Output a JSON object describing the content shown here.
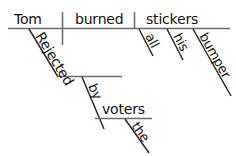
{
  "diagram": {
    "type": "reed-kellogg-sentence-diagram",
    "sentence": "Tom burned all his bumper stickers. Rejected by the voters.",
    "baseline": {
      "subject": "Tom",
      "verb": "burned",
      "direct_object": "stickers"
    },
    "modifiers": {
      "stickers": [
        "all",
        "his",
        "bumper"
      ],
      "voters": [
        "the"
      ]
    },
    "participial_phrase": {
      "participle": "Rejected",
      "preposition": "by",
      "object_of_preposition": "voters"
    },
    "words": {
      "tom": "Tom",
      "burned": "burned",
      "stickers": "stickers",
      "all": "all",
      "his": "his",
      "bumper": "bumper",
      "rejected": "Rejected",
      "by": "by",
      "voters": "voters",
      "the": "the"
    },
    "colors": {
      "line": "#6b6b6b",
      "slash": "#2a2a2a",
      "text": "#111111",
      "background": "#ffffff"
    }
  }
}
